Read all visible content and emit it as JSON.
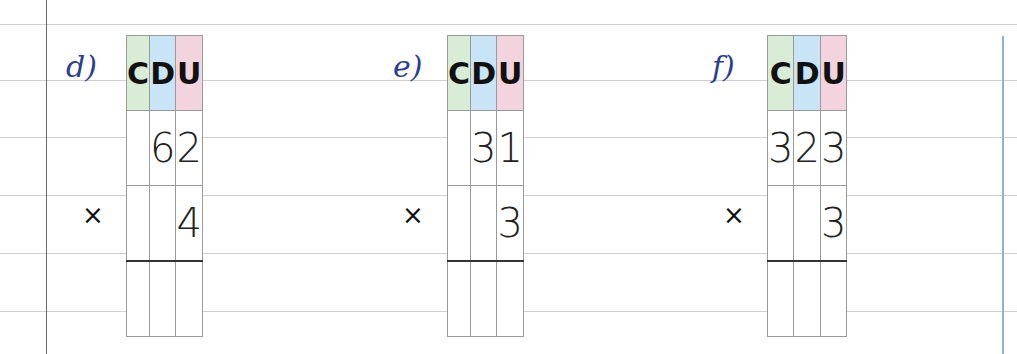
{
  "headers": [
    "C",
    "D",
    "U"
  ],
  "colors": {
    "C": "#d8ecd6",
    "D": "#c8e4f6",
    "U": "#f3d3de",
    "label": "#2a3f8f"
  },
  "operator": "×",
  "exercises": [
    {
      "label": "d)",
      "multiplicand": [
        "",
        "6",
        "2"
      ],
      "multiplier": [
        "",
        "",
        "4"
      ],
      "result": [
        "",
        "",
        ""
      ]
    },
    {
      "label": "e)",
      "multiplicand": [
        "",
        "3",
        "1"
      ],
      "multiplier": [
        "",
        "",
        "3"
      ],
      "result": [
        "",
        "",
        ""
      ]
    },
    {
      "label": "f)",
      "multiplicand": [
        "3",
        "2",
        "3"
      ],
      "multiplier": [
        "",
        "",
        "3"
      ],
      "result": [
        "",
        "",
        ""
      ]
    }
  ]
}
